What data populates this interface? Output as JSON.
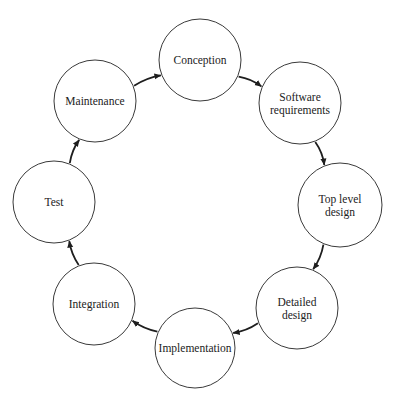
{
  "diagram": {
    "type": "cycle",
    "nodes": [
      {
        "id": "conception",
        "label": [
          "Conception"
        ],
        "cx": 200,
        "cy": 60,
        "r": 41
      },
      {
        "id": "software-requirements",
        "label": [
          "Software",
          "requirements"
        ],
        "cx": 300,
        "cy": 103,
        "r": 41
      },
      {
        "id": "top-level-design",
        "label": [
          "Top level",
          "design"
        ],
        "cx": 340,
        "cy": 205,
        "r": 42
      },
      {
        "id": "detailed-design",
        "label": [
          "Detailed",
          "design"
        ],
        "cx": 297,
        "cy": 308,
        "r": 41
      },
      {
        "id": "implementation",
        "label": [
          "Implementation"
        ],
        "cx": 195,
        "cy": 348,
        "r": 40
      },
      {
        "id": "integration",
        "label": [
          "Integration"
        ],
        "cx": 94,
        "cy": 304,
        "r": 41
      },
      {
        "id": "test",
        "label": [
          "Test"
        ],
        "cx": 54,
        "cy": 202,
        "r": 41
      },
      {
        "id": "maintenance",
        "label": [
          "Maintenance"
        ],
        "cx": 95,
        "cy": 101,
        "r": 41
      }
    ],
    "edges": [
      {
        "from": "conception",
        "to": "software-requirements"
      },
      {
        "from": "software-requirements",
        "to": "top-level-design"
      },
      {
        "from": "top-level-design",
        "to": "detailed-design"
      },
      {
        "from": "detailed-design",
        "to": "implementation"
      },
      {
        "from": "implementation",
        "to": "integration"
      },
      {
        "from": "integration",
        "to": "test"
      },
      {
        "from": "test",
        "to": "maintenance"
      },
      {
        "from": "maintenance",
        "to": "conception"
      }
    ],
    "colors": {
      "stroke": "#3a3a3a",
      "arrow": "#1e1e1e",
      "text": "#222222",
      "background": "#ffffff"
    }
  }
}
